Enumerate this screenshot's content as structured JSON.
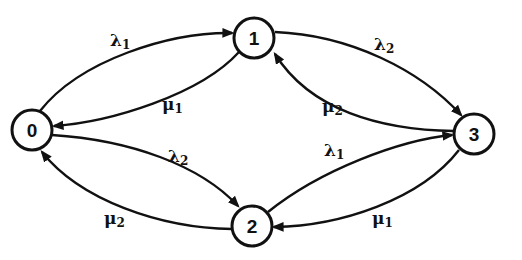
{
  "diagram": {
    "type": "state-transition",
    "colors": {
      "stroke": "#111111",
      "background": "#ffffff"
    },
    "nodes": [
      {
        "id": "0",
        "label": "0",
        "cx": 32,
        "cy": 130
      },
      {
        "id": "1",
        "label": "1",
        "cx": 254,
        "cy": 38
      },
      {
        "id": "2",
        "label": "2",
        "cx": 252,
        "cy": 226
      },
      {
        "id": "3",
        "label": "3",
        "cx": 474,
        "cy": 134
      }
    ],
    "edges": [
      {
        "from": "0",
        "to": "1",
        "symbol": "λ",
        "sub": "1",
        "x": 110,
        "y": 46
      },
      {
        "from": "1",
        "to": "0",
        "symbol": "μ",
        "sub": "1",
        "x": 162,
        "y": 110
      },
      {
        "from": "1",
        "to": "3",
        "symbol": "λ",
        "sub": "2",
        "x": 374,
        "y": 50
      },
      {
        "from": "3",
        "to": "1",
        "symbol": "μ",
        "sub": "2",
        "x": 322,
        "y": 112
      },
      {
        "from": "0",
        "to": "2",
        "symbol": "λ",
        "sub": "2",
        "x": 168,
        "y": 162
      },
      {
        "from": "2",
        "to": "0",
        "symbol": "μ",
        "sub": "2",
        "x": 104,
        "y": 224
      },
      {
        "from": "2",
        "to": "3",
        "symbol": "λ",
        "sub": "1",
        "x": 324,
        "y": 156
      },
      {
        "from": "3",
        "to": "2",
        "symbol": "μ",
        "sub": "1",
        "x": 372,
        "y": 224
      }
    ]
  }
}
